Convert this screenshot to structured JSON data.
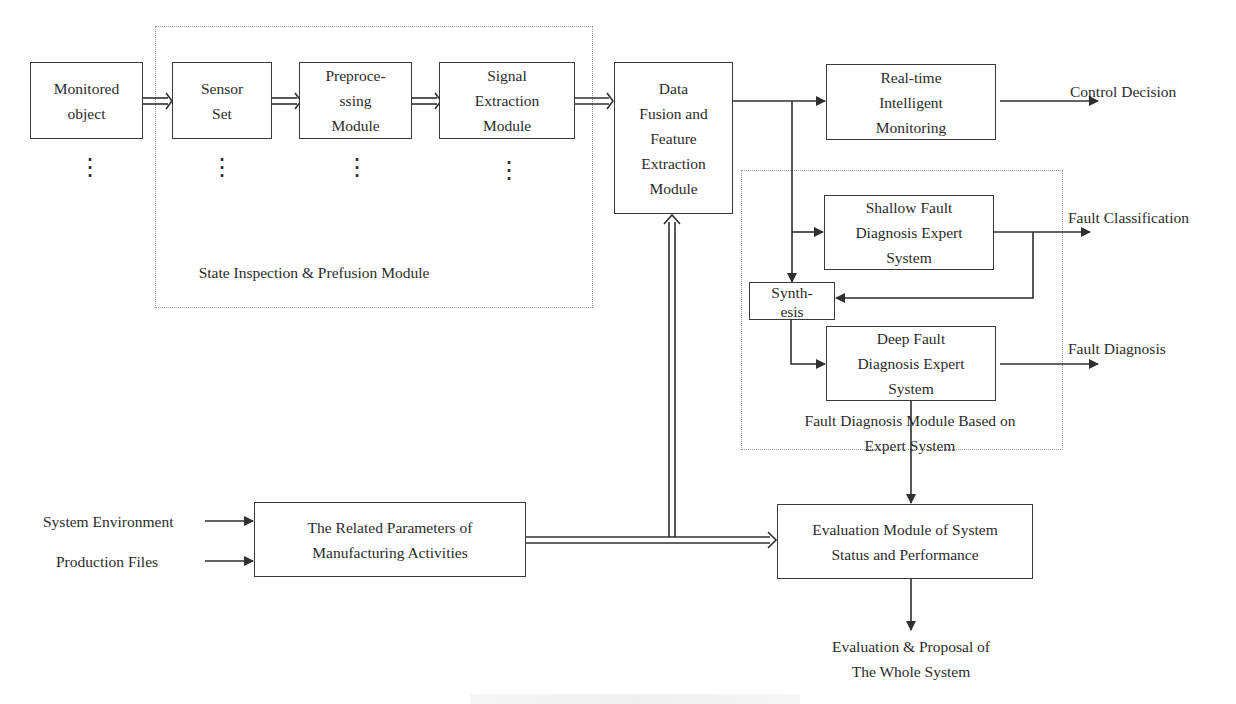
{
  "diagram": {
    "groups": {
      "state_inspection": {
        "label": "State Inspection & Prefusion Module"
      },
      "fault_diagnosis": {
        "label": "Fault Diagnosis Module Based on\nExpert System"
      }
    },
    "nodes": {
      "monitored_object": "Monitored\nobject",
      "sensor_set": "Sensor\nSet",
      "preprocessing": "Preproce-\nssing\nModule",
      "signal_extraction": "Signal\nExtraction\nModule",
      "data_fusion": "Data\nFusion and\nFeature\nExtraction\nModule",
      "realtime_monitoring": "Real-time\nIntelligent\nMonitoring",
      "shallow_fault": "Shallow Fault\nDiagnosis Expert\nSystem",
      "synthesis": "Synth-\nesis",
      "deep_fault": "Deep Fault\nDiagnosis Expert\nSystem",
      "related_parameters": "The Related Parameters of\nManufacturing Activities",
      "evaluation_module": "Evaluation Module of System\nStatus and Performance"
    },
    "outputs": {
      "control_decision": "Control Decision",
      "fault_classification": "Fault Classification",
      "fault_diagnosis": "Fault Diagnosis",
      "evaluation_proposal": "Evaluation & Proposal of\nThe Whole System"
    },
    "inputs": {
      "system_environment": "System Environment",
      "production_files": "Production Files"
    },
    "ellipsis": "⋮",
    "colors": {
      "line": "#2f2f2f",
      "group_border": "#9a9a9a",
      "text": "#2b2b2b"
    }
  }
}
